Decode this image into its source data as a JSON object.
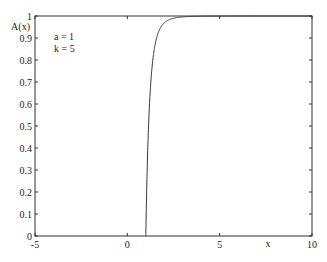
{
  "chart_data": {
    "type": "line",
    "title": "",
    "xlabel": "x",
    "ylabel": "A(x)",
    "xlim": [
      -5,
      10
    ],
    "ylim": [
      0,
      1
    ],
    "grid": false,
    "x_ticks": [
      "-5",
      "0",
      "5",
      "10"
    ],
    "y_ticks": [
      "0",
      "0.1",
      "0.2",
      "0.3",
      "0.4",
      "0.5",
      "0.6",
      "0.7",
      "0.8",
      "0.9",
      "1"
    ],
    "annotations": [
      "a = 1",
      "k = 5"
    ],
    "params": {
      "a": 1,
      "k": 5
    },
    "series": [
      {
        "name": "A(x)",
        "x": [
          1,
          1.1,
          1.2,
          1.3,
          1.4,
          1.5,
          1.6,
          1.8,
          2,
          2.5,
          3,
          4,
          5,
          6,
          8,
          10
        ],
        "values": [
          0,
          0.379,
          0.598,
          0.731,
          0.814,
          0.868,
          0.905,
          0.947,
          0.969,
          0.99,
          0.996,
          0.999,
          1.0,
          1.0,
          1.0,
          1.0
        ]
      }
    ]
  },
  "colors": {
    "line": "#333333",
    "axes": "#333333",
    "background": "#ffffff"
  }
}
